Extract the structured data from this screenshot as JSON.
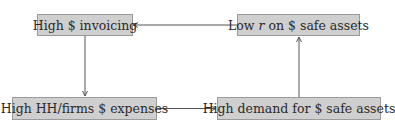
{
  "diagram": {
    "type": "flow-cycle",
    "nodes": [
      {
        "id": "n1",
        "label": "High $ invoicing"
      },
      {
        "id": "n2",
        "label_pre": "Low ",
        "label_var": "r",
        "label_post": " on $ safe assets",
        "label": "Low r on $ safe assets"
      },
      {
        "id": "n3",
        "label": "High HH/firms $ expenses"
      },
      {
        "id": "n4",
        "label": "High demand for $ safe assets"
      }
    ],
    "edges": [
      {
        "from": "n1",
        "to": "n3"
      },
      {
        "from": "n3",
        "to": "n4"
      },
      {
        "from": "n4",
        "to": "n2"
      },
      {
        "from": "n2",
        "to": "n1"
      }
    ],
    "colors": {
      "node_fill": "#cfcfcf",
      "node_border": "#9a9a9a",
      "edge": "#555555",
      "text": "#2a2a2a"
    }
  }
}
